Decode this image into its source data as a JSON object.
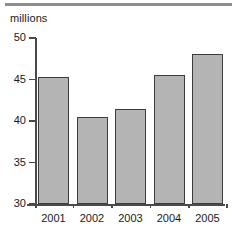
{
  "chart_data": {
    "type": "bar",
    "title": "",
    "subtitle": "",
    "xlabel": "",
    "ylabel": "millions",
    "unit_caption": "millions",
    "categories": [
      "2001",
      "2002",
      "2003",
      "2004",
      "2005"
    ],
    "values": [
      45.3,
      40.5,
      41.5,
      45.6,
      48.1
    ],
    "ylim": [
      30,
      50
    ],
    "yticks": [
      30,
      35,
      40,
      45,
      50
    ],
    "ytick_labels": [
      "30",
      "35",
      "40",
      "45",
      "50"
    ],
    "xtick_labels": [
      "2001",
      "2002",
      "2003",
      "2004",
      "2005"
    ],
    "grid": false,
    "legend": null,
    "legend_position": "none",
    "series": [
      {
        "name": "millions",
        "values": [
          45.3,
          40.5,
          41.5,
          45.6,
          48.1
        ]
      }
    ],
    "colors": {
      "bar_fill": "#b4b4b4",
      "bar_edge": "#3d3d3d",
      "axis": "#4a4a4a",
      "text": "#1a1a1a",
      "top_rule": "#8e8e8e",
      "background": "#ffffff"
    },
    "annotations": []
  },
  "figure": {
    "unit_caption": "millions",
    "top_rule": "horizontal-rule"
  }
}
